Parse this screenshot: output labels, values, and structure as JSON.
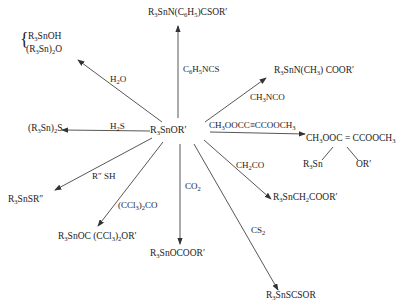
{
  "diagram": {
    "center": {
      "label": "R3SnOR'"
    },
    "branches": [
      {
        "id": "h2o",
        "reagent": "H2O",
        "products": [
          "R3SnOH",
          "(R3Sn)2O"
        ]
      },
      {
        "id": "phenyl-isothiocyanate",
        "reagent": "C6H5NCS",
        "product": "R3SnN(C6H5)CSOR'"
      },
      {
        "id": "methyl-isocyanate",
        "reagent": "CH3NCO",
        "product": "R3SnN(CH3) COOR'"
      },
      {
        "id": "dmad",
        "reagent": "CH3OOCC≡CCOOCH3",
        "product": "CH3OOC = CCOOCH3",
        "product_substituents": [
          "R3Sn",
          "OR'"
        ]
      },
      {
        "id": "ketene",
        "reagent": "CH2CO",
        "product": "R3SnCH2COOR'"
      },
      {
        "id": "cs2",
        "reagent": "CS2",
        "product": "R3SnSCSOR"
      },
      {
        "id": "co2",
        "reagent": "CO2",
        "product": "R3SnOCOOR'"
      },
      {
        "id": "hexachloroacetone",
        "reagent": "(CCl3)2CO",
        "product": "R3SnOC (CCl3)2OR'"
      },
      {
        "id": "thiol",
        "reagent": "R'' SH",
        "product": "R3SnSR''"
      },
      {
        "id": "h2s",
        "reagent": "H2S",
        "product": "(R3Sn)2S"
      }
    ]
  }
}
